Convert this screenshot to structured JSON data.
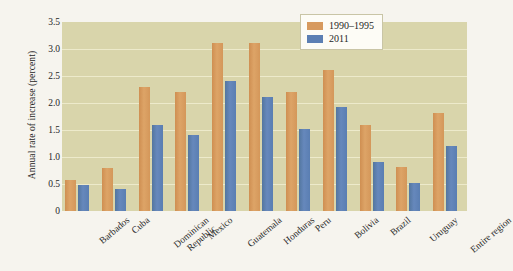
{
  "chart_data": {
    "type": "bar",
    "title": "",
    "subtitle": "",
    "xlabel": "",
    "ylabel": "Annual rate of increase (percent)",
    "ylim": [
      0,
      3.5
    ],
    "ytick_labels": [
      "3.5",
      "3.0",
      "2.5",
      "2.0",
      "1.5",
      "1.0",
      "0.5",
      "0"
    ],
    "ytick_values": [
      3.5,
      3.0,
      2.5,
      2.0,
      1.5,
      1.0,
      0.5,
      0
    ],
    "grid": true,
    "legend_position": "top-right",
    "categories": [
      "Barbados",
      "Cuba",
      "Dominican Republic",
      "Mexico",
      "Guatemala",
      "Honduras",
      "Peru",
      "Bolivia",
      "Brazil",
      "Uruguay",
      "Entire region"
    ],
    "category_lines": [
      [
        "Barbados"
      ],
      [
        "Cuba"
      ],
      [
        "Dominican",
        "Republic"
      ],
      [
        "Mexico"
      ],
      [
        "Guatemala"
      ],
      [
        "Honduras"
      ],
      [
        "Peru"
      ],
      [
        "Bolivia"
      ],
      [
        "Brazil"
      ],
      [
        "Uruguay"
      ],
      [
        "Entire region"
      ]
    ],
    "series": [
      {
        "name": "1990–1995",
        "color": "#d79a5e",
        "values": [
          0.57,
          0.79,
          2.3,
          2.2,
          3.12,
          3.12,
          2.2,
          2.61,
          1.6,
          0.81,
          1.81
        ]
      },
      {
        "name": "2011",
        "color": "#5c7fb3",
        "values": [
          0.49,
          0.4,
          1.6,
          1.4,
          2.4,
          2.12,
          1.51,
          1.92,
          0.91,
          0.51,
          1.21
        ]
      }
    ]
  },
  "legend": {
    "entries": [
      {
        "label": "1990–1995",
        "color": "#d79a5e"
      },
      {
        "label": "2011",
        "color": "#5c7fb3"
      }
    ]
  },
  "colors": {
    "series_1990_1995": "#d79a5e",
    "series_2011": "#5c7fb3",
    "plot_background": "#d9d5ab",
    "gridline": "#efeccd",
    "page_background": "#f6f4ee",
    "legend_background": "#fdfcf6",
    "text": "#2b2b2b"
  }
}
